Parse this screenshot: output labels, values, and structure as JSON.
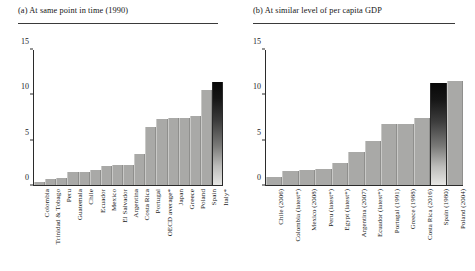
{
  "figure": {
    "panels": [
      {
        "key": "panel_a",
        "title": "(a) At same point in time (1990)"
      },
      {
        "key": "panel_b",
        "title": "(b) At similar level of per capita GDP"
      }
    ]
  },
  "chart_data": [
    {
      "type": "bar",
      "panel": "a",
      "title": "(a) At same point in time (1990)",
      "xlabel": "",
      "ylabel": "",
      "ylim": [
        0,
        15
      ],
      "yticks": [
        0,
        5,
        10,
        15
      ],
      "ytick_labels": [
        "0",
        "5",
        "10",
        "15"
      ],
      "grid": false,
      "legend": false,
      "categories": [
        "Colombia",
        "Trinidad & Tobago",
        "Peru",
        "Guatemala",
        "Chile",
        "Ecuador",
        "Mexico",
        "El Salvador",
        "Argentina",
        "Costa Rica",
        "Portugal",
        "OECD average*",
        "Japan",
        "Greece",
        "Poland",
        "Spain",
        "Italy*"
      ],
      "values": [
        0.3,
        0.7,
        0.8,
        1.5,
        1.5,
        1.7,
        2.1,
        2.2,
        2.2,
        3.4,
        6.5,
        7.3,
        7.4,
        7.5,
        7.7,
        10.6,
        11.4,
        11.3
      ],
      "highlight_index": 16,
      "highlight_category": "Spain",
      "bar_color": "#a9a9a7",
      "highlight_color": "#111111"
    },
    {
      "type": "bar",
      "panel": "b",
      "title": "(b) At similar level of per capita GDP",
      "xlabel": "",
      "ylabel": "",
      "ylim": [
        0,
        15
      ],
      "yticks": [
        0,
        5,
        10,
        15
      ],
      "ytick_labels": [
        "0",
        "5",
        "10",
        "15"
      ],
      "grid": false,
      "legend": false,
      "categories": [
        "Chile (2006)",
        "Colombia (latest*)",
        "Mexico (2008)",
        "Peru (latest*)",
        "Egypt (latest*)",
        "Argentina (2007)",
        "Ecuador (latest*)",
        "Portugal (1991)",
        "Greece (1988)",
        "Costa Rica (2016)",
        "Spain (1980)",
        "Poland (2004)"
      ],
      "values": [
        0.9,
        1.6,
        1.7,
        1.8,
        2.4,
        3.7,
        4.9,
        6.8,
        6.8,
        7.5,
        11.3,
        11.6
      ],
      "highlight_index": 10,
      "highlight_category": "Spain (1980)",
      "bar_color": "#a9a9a7",
      "highlight_color": "#111111"
    }
  ]
}
